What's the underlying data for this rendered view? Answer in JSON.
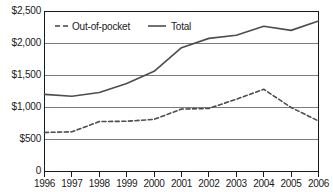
{
  "chart_data": {
    "type": "line",
    "title": "",
    "xlabel": "",
    "ylabel": "",
    "x": [
      1996,
      1997,
      1998,
      1999,
      2000,
      2001,
      2002,
      2003,
      2004,
      2005,
      2006
    ],
    "categories": [
      "1996",
      "1997",
      "1998",
      "1999",
      "2000",
      "2001",
      "2002",
      "2003",
      "2004",
      "2005",
      "2006"
    ],
    "series": [
      {
        "name": "Out-of-pocket",
        "style": "dashed",
        "color": "#4d4d4d",
        "values": [
          610,
          620,
          780,
          785,
          815,
          975,
          985,
          1130,
          1285,
          1000,
          790
        ]
      },
      {
        "name": "Total",
        "style": "solid",
        "color": "#4d4d4d",
        "values": [
          1205,
          1175,
          1235,
          1375,
          1565,
          1935,
          2080,
          2130,
          2270,
          2205,
          2350
        ]
      }
    ],
    "ylim": [
      0,
      2500
    ],
    "yticks": [
      0,
      500,
      1000,
      1500,
      2000,
      2500
    ],
    "ytick_labels": [
      "0",
      "$500",
      "$1,000",
      "$1,500",
      "$2,000",
      "$2,500"
    ],
    "grid": true,
    "grid_axis": "y",
    "legend_position": "top-left-inside",
    "legend": [
      "Out-of-pocket",
      "Total"
    ]
  },
  "axes": {
    "y_labels": [
      "$2,500",
      "$2,000",
      "$1,500",
      "$1,000",
      "$500",
      "0"
    ],
    "x_labels": [
      "1996",
      "1997",
      "1998",
      "1999",
      "2000",
      "2001",
      "2002",
      "2003",
      "2004",
      "2005",
      "2006"
    ]
  },
  "legend": {
    "items": [
      {
        "label": "Out-of-pocket",
        "style": "dashed"
      },
      {
        "label": "Total",
        "style": "solid"
      }
    ]
  },
  "colors": {
    "line": "#4d4d4d",
    "grid": "#7a7a7a",
    "axis": "#1a1a1a",
    "text": "#1a1a1a",
    "background": "#ffffff"
  }
}
